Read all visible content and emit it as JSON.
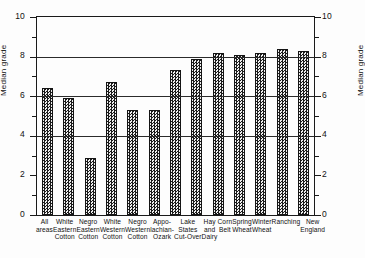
{
  "chart_data": {
    "type": "bar",
    "title": "",
    "xlabel": "",
    "ylabel": "Median grade",
    "ylabel_right": "Median grade",
    "ylim": [
      0,
      10
    ],
    "yticks_major": [
      0,
      2,
      4,
      6,
      8,
      10
    ],
    "yticks_minor": [
      1,
      3,
      5,
      7,
      9
    ],
    "ytick_labels": [
      "0",
      "2",
      "4",
      "6",
      "8",
      "10"
    ],
    "grid": true,
    "gridlines": [
      4,
      6,
      8,
      10
    ],
    "legend": "none",
    "categories": [
      "All areas",
      "White Eastern Cotton",
      "Negro Eastern Cotton",
      "White Western Cotton",
      "Negro Western Cotton",
      "Appalachian-Ozark",
      "Lake States Cut-Over",
      "Hay and Dairy",
      "Corn Belt",
      "Spring Wheat",
      "Winter Wheat",
      "Ranching",
      "New England"
    ],
    "category_lines": [
      [
        "All",
        "areas",
        ""
      ],
      [
        "White",
        "Eastern",
        "Cotton"
      ],
      [
        "Negro",
        "Eastern",
        "Cotton"
      ],
      [
        "White",
        "Western",
        "Cotton"
      ],
      [
        "Negro",
        "Western",
        "Cotton"
      ],
      [
        "Appo-",
        "lachian-",
        "Ozark"
      ],
      [
        "Lake",
        "States",
        "Cut-Over"
      ],
      [
        "Hay",
        "and",
        "Dairy"
      ],
      [
        "Corn",
        "Belt",
        ""
      ],
      [
        "Spring",
        "Wheat",
        ""
      ],
      [
        "Winter",
        "Wheat",
        ""
      ],
      [
        "Ranching",
        "",
        ""
      ],
      [
        "New",
        "England",
        ""
      ]
    ],
    "values": [
      6.4,
      5.9,
      2.9,
      6.7,
      5.3,
      5.3,
      7.3,
      7.9,
      8.2,
      8.1,
      8.2,
      8.4,
      8.3
    ],
    "bar_color": "#2b2b2b",
    "bar_pattern": "checkerboard"
  }
}
